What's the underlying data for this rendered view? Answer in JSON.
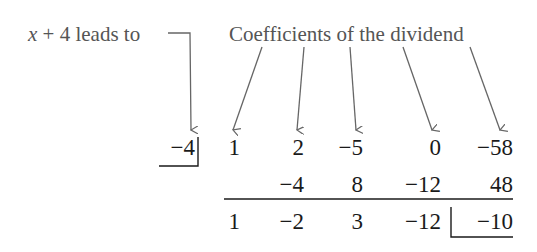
{
  "annotations": {
    "divisor_label_var": "x",
    "divisor_label_rest": " + 4 leads to",
    "coefficients_label": "Coefficients of the dividend"
  },
  "synthetic_division": {
    "divisor": "−4",
    "dividend_coefficients": [
      "1",
      "2",
      "−5",
      "0",
      "−58"
    ],
    "products_row": [
      "",
      "−4",
      "8",
      "−12",
      "48"
    ],
    "result_row": [
      "1",
      "−2",
      "3",
      "−12"
    ],
    "remainder": "−10"
  },
  "colors": {
    "annotation": "#555555",
    "numbers": "#1a1a1a"
  }
}
